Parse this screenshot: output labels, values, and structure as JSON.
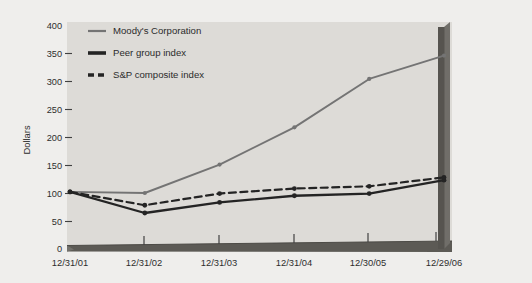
{
  "chart_data": {
    "type": "line",
    "title": "",
    "xlabel": "",
    "ylabel": "Dollars",
    "categories": [
      "12/31/01",
      "12/31/02",
      "12/31/03",
      "12/31/04",
      "12/30/05",
      "12/29/06"
    ],
    "ylim": [
      0,
      400
    ],
    "yticks": [
      0,
      50,
      100,
      150,
      200,
      250,
      300,
      350,
      400
    ],
    "ytick_labels": [
      "0",
      "50",
      "100",
      "150",
      "200",
      "250",
      "300",
      "350",
      "400"
    ],
    "grid": false,
    "legend_position": "top-left",
    "series": [
      {
        "name": "Moody's Corporation",
        "style": "solid-thin",
        "color": "#6f6f6f",
        "values": [
          100,
          98,
          149,
          216,
          303,
          345
        ]
      },
      {
        "name": "Peer group index",
        "style": "solid-thick",
        "color": "#1c1c1c",
        "values": [
          100,
          62,
          81,
          93,
          97,
          121
        ]
      },
      {
        "name": "S&P composite index",
        "style": "dashed",
        "color": "#1c1c1c",
        "values": [
          100,
          76,
          97,
          106,
          110,
          126
        ]
      }
    ]
  },
  "axis": {
    "y_title": "Dollars",
    "y_ticks": [
      "400",
      "350",
      "300",
      "250",
      "200",
      "150",
      "100",
      "50",
      "0"
    ],
    "x_ticks": [
      "12/31/01",
      "12/31/02",
      "12/31/03",
      "12/31/04",
      "12/30/05",
      "12/29/06"
    ]
  },
  "legend": {
    "items": [
      {
        "label": "Moody's Corporation",
        "swatch": "thin-gray-line"
      },
      {
        "label": "Peer group index",
        "swatch": "thick-black-line"
      },
      {
        "label": "S&P composite index",
        "swatch": "dashed-black-line"
      }
    ]
  },
  "colors": {
    "page_background": "#efeeec",
    "plot_background": "#dcdad6",
    "moodys_line": "#6f6f6f",
    "peer_line": "#1c1c1c",
    "sp_line": "#1c1c1c",
    "axis_bar": "#5c5a58",
    "text": "#262626"
  }
}
